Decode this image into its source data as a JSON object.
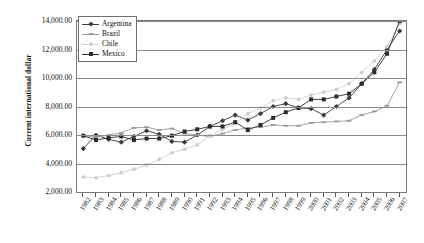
{
  "chart_data": {
    "type": "line",
    "title": "",
    "xlabel": "",
    "ylabel": "Current international dollar",
    "ylim": [
      2000,
      14000
    ],
    "ytick_step": 2000,
    "ytick_labels": [
      "14,000.00",
      "12,000.00",
      "10,000.00",
      "8,000.00",
      "6,000.00",
      "4,000.00",
      "2,000.00"
    ],
    "ytick_values": [
      14000,
      12000,
      10000,
      8000,
      6000,
      4000,
      2000
    ],
    "grid": true,
    "legend_position": "top-left",
    "categories": [
      "1982",
      "1983",
      "1984",
      "1985",
      "1986",
      "1987",
      "1988",
      "1989",
      "1990",
      "1991",
      "1992",
      "1993",
      "1994",
      "1995",
      "1996",
      "1997",
      "1998",
      "1999",
      "2000",
      "2001",
      "2002",
      "2003",
      "2004",
      "2005",
      "2006",
      "2007"
    ],
    "series": [
      {
        "name": "Argentina",
        "color": "#333333",
        "marker": "diamond",
        "values": [
          5000,
          5150,
          5350,
          5000,
          5250,
          5400,
          5200,
          4800,
          4750,
          5200,
          5650,
          6000,
          6350,
          6050,
          6400,
          6900,
          7100,
          6850,
          6800,
          6400,
          5700,
          6300,
          7050,
          7800,
          8700,
          9500
        ]
      },
      {
        "name": "Brazil",
        "color": "#8c8c8c",
        "marker": "dash",
        "values": [
          5900,
          5800,
          5900,
          6100,
          6450,
          6400,
          6250,
          6350,
          6000,
          5950,
          5800,
          6000,
          6250,
          6350,
          6400,
          6550,
          6500,
          6500,
          6700,
          6700,
          6750,
          6800,
          7150,
          7350,
          7650,
          8050
        ]
      },
      {
        "name": "Chile",
        "color": "#c9c9c9",
        "marker": "dot",
        "values": [
          3050,
          3000,
          3150,
          3300,
          3500,
          3750,
          4050,
          4450,
          4600,
          4900,
          5450,
          5800,
          6100,
          6650,
          7050,
          7500,
          7750,
          7700,
          7950,
          8150,
          8350,
          8650,
          9250,
          9850,
          10400,
          10900
        ]
      },
      {
        "name": "Mexico",
        "color": "#2b2b2b",
        "marker": "square",
        "values": [
          5950,
          5650,
          5800,
          5850,
          5600,
          5700,
          5700,
          5900,
          6150,
          6300,
          6450,
          6450,
          6700,
          6200,
          6500,
          6900,
          7200,
          7400,
          7800,
          7750,
          7800,
          7850,
          8200,
          8450,
          8850,
          9150
        ]
      }
    ],
    "series_render": [
      {
        "name": "Argentina",
        "color": "#3a3a3a",
        "marker": "diamond",
        "values": [
          5050,
          6000,
          5700,
          5500,
          5900,
          6300,
          6050,
          5550,
          5500,
          6000,
          6600,
          7000,
          7400,
          7050,
          7500,
          8000,
          8200,
          7900,
          7850,
          7400,
          8000,
          8600,
          9600,
          10600,
          12000,
          13300
        ]
      },
      {
        "name": "Brazil",
        "color": "#9a9a9a",
        "marker": "dash",
        "values": [
          5950,
          5850,
          6000,
          6150,
          6500,
          6550,
          6350,
          6450,
          6100,
          6000,
          5900,
          6100,
          6350,
          6500,
          6550,
          6700,
          6650,
          6650,
          6850,
          6900,
          6950,
          7000,
          7400,
          7650,
          8050,
          9700
        ]
      },
      {
        "name": "Chile",
        "color": "#cfcfcf",
        "marker": "dot",
        "values": [
          3050,
          3000,
          3150,
          3350,
          3600,
          3900,
          4300,
          4750,
          5000,
          5300,
          5950,
          6400,
          6800,
          7500,
          7900,
          8400,
          8600,
          8500,
          8800,
          9000,
          9200,
          9600,
          10400,
          11200,
          12200,
          13800
        ]
      },
      {
        "name": "Mexico",
        "color": "#2b2b2b",
        "marker": "square",
        "values": [
          5950,
          5650,
          5800,
          5900,
          5650,
          5750,
          5750,
          5950,
          6250,
          6400,
          6600,
          6600,
          6900,
          6350,
          6700,
          7200,
          7600,
          7900,
          8500,
          8500,
          8700,
          8900,
          9600,
          10400,
          11700,
          14000
        ]
      }
    ]
  }
}
